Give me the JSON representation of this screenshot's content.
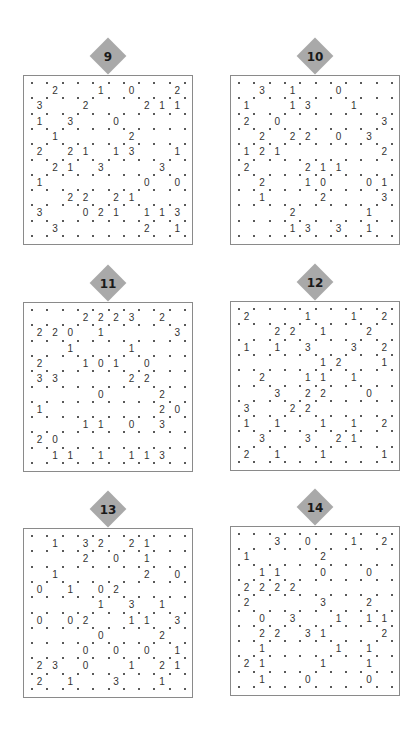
{
  "grid_size": 10,
  "colors": {
    "badge": "#a9a9a9",
    "badge_text": "#1a1a1a",
    "border": "#8a8a8a",
    "dot": "#222222",
    "clue": "#333333"
  },
  "puzzles": [
    {
      "number": "9",
      "rows": [
        [
          " ",
          "2",
          " ",
          " ",
          "1",
          " ",
          "0",
          " ",
          " ",
          "2"
        ],
        [
          "3",
          " ",
          " ",
          "2",
          " ",
          " ",
          " ",
          "2",
          "1",
          "1"
        ],
        [
          "1",
          " ",
          "3",
          " ",
          " ",
          "0",
          " ",
          " ",
          " ",
          " "
        ],
        [
          " ",
          "1",
          " ",
          " ",
          " ",
          " ",
          "2",
          " ",
          " ",
          " "
        ],
        [
          "2",
          " ",
          "2",
          "1",
          " ",
          "1",
          "3",
          " ",
          " ",
          "1"
        ],
        [
          " ",
          "2",
          "1",
          " ",
          "3",
          " ",
          " ",
          " ",
          "3",
          " "
        ],
        [
          "1",
          " ",
          " ",
          " ",
          " ",
          " ",
          " ",
          "0",
          " ",
          "0"
        ],
        [
          " ",
          " ",
          "2",
          "2",
          " ",
          "2",
          "1",
          " ",
          " ",
          " "
        ],
        [
          "3",
          " ",
          " ",
          "0",
          "2",
          "1",
          " ",
          "1",
          "1",
          "3"
        ],
        [
          " ",
          "3",
          " ",
          " ",
          " ",
          " ",
          " ",
          "2",
          " ",
          "1"
        ]
      ]
    },
    {
      "number": "10",
      "rows": [
        [
          " ",
          "3",
          " ",
          "1",
          " ",
          " ",
          "0",
          " ",
          " ",
          " "
        ],
        [
          "1",
          " ",
          " ",
          "1",
          "3",
          " ",
          " ",
          "1",
          " ",
          " "
        ],
        [
          "2",
          " ",
          "0",
          " ",
          " ",
          " ",
          " ",
          " ",
          " ",
          "3"
        ],
        [
          " ",
          "2",
          " ",
          "2",
          "2",
          " ",
          "0",
          " ",
          "3",
          " "
        ],
        [
          "1",
          "2",
          "1",
          " ",
          " ",
          " ",
          " ",
          " ",
          " ",
          "2"
        ],
        [
          "2",
          " ",
          " ",
          " ",
          "2",
          "1",
          "1",
          " ",
          " ",
          " "
        ],
        [
          " ",
          "2",
          " ",
          " ",
          "1",
          "0",
          " ",
          " ",
          "0",
          "1"
        ],
        [
          " ",
          "1",
          " ",
          " ",
          " ",
          "2",
          " ",
          " ",
          " ",
          "3"
        ],
        [
          " ",
          " ",
          " ",
          "2",
          " ",
          " ",
          " ",
          " ",
          "1",
          " "
        ],
        [
          " ",
          " ",
          " ",
          "1",
          "3",
          " ",
          "3",
          " ",
          "1",
          " "
        ]
      ]
    },
    {
      "number": "11",
      "rows": [
        [
          " ",
          " ",
          " ",
          "2",
          "2",
          "2",
          "3",
          " ",
          "2",
          " "
        ],
        [
          "2",
          "2",
          "0",
          " ",
          "1",
          " ",
          " ",
          " ",
          " ",
          "3"
        ],
        [
          " ",
          " ",
          "1",
          " ",
          " ",
          " ",
          "1",
          " ",
          " ",
          " "
        ],
        [
          "2",
          " ",
          " ",
          "1",
          "0",
          "1",
          " ",
          "0",
          " ",
          " "
        ],
        [
          "3",
          "3",
          " ",
          " ",
          " ",
          " ",
          "2",
          "2",
          " ",
          " "
        ],
        [
          " ",
          " ",
          " ",
          " ",
          "0",
          " ",
          " ",
          " ",
          "2",
          " "
        ],
        [
          "1",
          " ",
          " ",
          " ",
          " ",
          " ",
          " ",
          " ",
          "2",
          "0"
        ],
        [
          " ",
          " ",
          " ",
          "1",
          "1",
          " ",
          "0",
          " ",
          "3",
          " "
        ],
        [
          "2",
          "0",
          " ",
          " ",
          " ",
          " ",
          " ",
          " ",
          " ",
          " "
        ],
        [
          " ",
          "1",
          "1",
          " ",
          "1",
          " ",
          "1",
          "1",
          "3",
          " "
        ]
      ]
    },
    {
      "number": "12",
      "rows": [
        [
          "2",
          " ",
          " ",
          " ",
          "1",
          " ",
          " ",
          "1",
          " ",
          "2"
        ],
        [
          " ",
          " ",
          "2",
          "2",
          " ",
          "1",
          " ",
          " ",
          "2",
          " "
        ],
        [
          "1",
          " ",
          "1",
          " ",
          "3",
          " ",
          " ",
          "3",
          " ",
          "2"
        ],
        [
          " ",
          " ",
          " ",
          " ",
          " ",
          "1",
          "2",
          " ",
          " ",
          "1"
        ],
        [
          " ",
          "2",
          " ",
          " ",
          "1",
          "1",
          " ",
          "1",
          " ",
          " "
        ],
        [
          " ",
          " ",
          "3",
          " ",
          "2",
          "2",
          " ",
          " ",
          "0",
          " "
        ],
        [
          "3",
          " ",
          " ",
          "2",
          "2",
          " ",
          " ",
          " ",
          " ",
          " "
        ],
        [
          "1",
          " ",
          "1",
          " ",
          " ",
          "1",
          " ",
          "1",
          " ",
          "2"
        ],
        [
          " ",
          "3",
          " ",
          " ",
          "3",
          " ",
          "2",
          "1",
          " ",
          " "
        ],
        [
          "2",
          " ",
          "1",
          " ",
          " ",
          "1",
          " ",
          " ",
          " ",
          "1"
        ]
      ]
    },
    {
      "number": "13",
      "rows": [
        [
          " ",
          "1",
          " ",
          "3",
          "2",
          " ",
          "2",
          "1",
          " ",
          " "
        ],
        [
          " ",
          " ",
          " ",
          "2",
          " ",
          "0",
          " ",
          "1",
          " ",
          " "
        ],
        [
          " ",
          "1",
          " ",
          " ",
          " ",
          " ",
          " ",
          "2",
          " ",
          "0"
        ],
        [
          "0",
          " ",
          "1",
          " ",
          "0",
          "2",
          " ",
          " ",
          " ",
          " "
        ],
        [
          " ",
          " ",
          " ",
          " ",
          "1",
          " ",
          "3",
          " ",
          "1",
          " "
        ],
        [
          "0",
          " ",
          "0",
          "2",
          " ",
          " ",
          "1",
          "1",
          " ",
          "3"
        ],
        [
          " ",
          " ",
          " ",
          " ",
          "0",
          " ",
          " ",
          " ",
          "2",
          " "
        ],
        [
          " ",
          " ",
          " ",
          "0",
          " ",
          "0",
          " ",
          "0",
          " ",
          "1"
        ],
        [
          "2",
          "3",
          " ",
          "0",
          " ",
          " ",
          "1",
          " ",
          "2",
          "1"
        ],
        [
          "2",
          " ",
          "1",
          " ",
          " ",
          "3",
          " ",
          " ",
          "1",
          " "
        ]
      ]
    },
    {
      "number": "14",
      "rows": [
        [
          " ",
          " ",
          "3",
          " ",
          "0",
          " ",
          " ",
          "1",
          " ",
          "2"
        ],
        [
          "1",
          " ",
          " ",
          " ",
          " ",
          "2",
          " ",
          " ",
          " ",
          " "
        ],
        [
          " ",
          "1",
          "1",
          " ",
          " ",
          "0",
          " ",
          " ",
          "0",
          " "
        ],
        [
          "2",
          "2",
          "2",
          "2",
          " ",
          " ",
          " ",
          " ",
          " ",
          " "
        ],
        [
          "2",
          " ",
          " ",
          " ",
          " ",
          "3",
          " ",
          " ",
          "2",
          " "
        ],
        [
          " ",
          "0",
          " ",
          "3",
          " ",
          " ",
          "1",
          " ",
          "1",
          "1"
        ],
        [
          " ",
          "2",
          "2",
          " ",
          "3",
          "1",
          " ",
          " ",
          " ",
          "2"
        ],
        [
          " ",
          "1",
          " ",
          " ",
          " ",
          " ",
          "1",
          " ",
          "1",
          " "
        ],
        [
          "2",
          "1",
          " ",
          " ",
          " ",
          "1",
          " ",
          " ",
          "1",
          " "
        ],
        [
          " ",
          "1",
          " ",
          " ",
          "0",
          " ",
          " ",
          " ",
          "0",
          " "
        ]
      ]
    }
  ]
}
